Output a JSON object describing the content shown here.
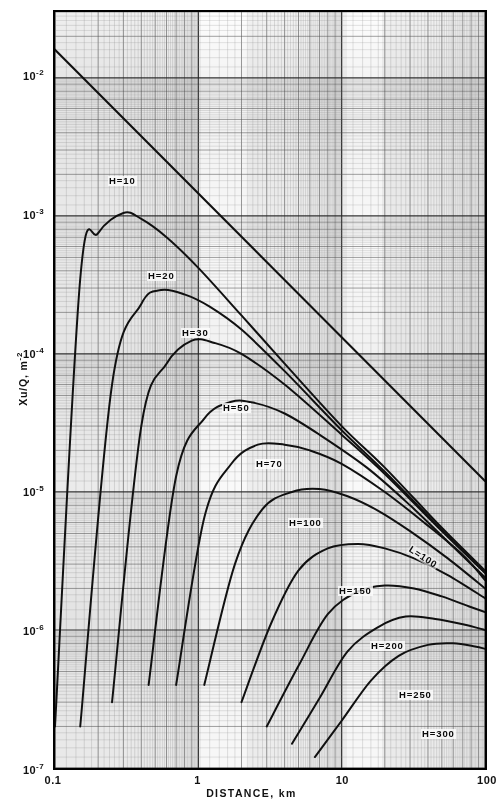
{
  "figure": {
    "title": "",
    "x_axis_title": "DISTANCE, km",
    "y_axis_title_html": "Xu/Q, m",
    "y_axis_title_exp": "-2"
  },
  "axes": {
    "x_ticks": [
      {
        "label": "0.1",
        "value": 0.1
      },
      {
        "label": "1",
        "value": 1
      },
      {
        "label": "10",
        "value": 10
      },
      {
        "label": "100",
        "value": 100
      }
    ],
    "y_ticks": [
      {
        "mantissa": "10",
        "exp": "-2",
        "value": 0.01
      },
      {
        "mantissa": "10",
        "exp": "-3",
        "value": 0.001
      },
      {
        "mantissa": "10",
        "exp": "-4",
        "value": 0.0001
      },
      {
        "mantissa": "10",
        "exp": "-5",
        "value": 1e-05
      },
      {
        "mantissa": "10",
        "exp": "-6",
        "value": 1e-06
      },
      {
        "mantissa": "10",
        "exp": "-7",
        "value": 1e-07
      }
    ]
  },
  "curve_labels": [
    {
      "text": "H=10",
      "x": 108,
      "y": 176,
      "rot": false
    },
    {
      "text": "H=20",
      "x": 147,
      "y": 271,
      "rot": false
    },
    {
      "text": "H=30",
      "x": 181,
      "y": 328,
      "rot": false
    },
    {
      "text": "H=50",
      "x": 222,
      "y": 403,
      "rot": false
    },
    {
      "text": "H=70",
      "x": 255,
      "y": 459,
      "rot": false
    },
    {
      "text": "H=100",
      "x": 288,
      "y": 518,
      "rot": false
    },
    {
      "text": "H=150",
      "x": 338,
      "y": 586,
      "rot": false
    },
    {
      "text": "H=200",
      "x": 370,
      "y": 641,
      "rot": false
    },
    {
      "text": "H=250",
      "x": 398,
      "y": 690,
      "rot": false
    },
    {
      "text": "H=300",
      "x": 421,
      "y": 729,
      "rot": false
    },
    {
      "text": "L=100",
      "x": 409,
      "y": 543,
      "rot": true
    }
  ],
  "colors": {
    "curve": "#111111",
    "frame": "#000000",
    "grid_minor": "#8d8d8d",
    "grid_major": "#2b2b2b",
    "background": "#ffffff",
    "paper": "#fdfdfd"
  },
  "chart_data": {
    "type": "line",
    "title": "",
    "xlabel": "DISTANCE, km",
    "ylabel": "Xu/Q, m-2",
    "xscale": "log",
    "yscale": "log",
    "xlim": [
      0.1,
      100
    ],
    "ylim": [
      1e-07,
      0.03
    ],
    "grid": true,
    "legend": "inline curve labels",
    "series": [
      {
        "name": "L=100",
        "label": "L=100",
        "type": "envelope-line",
        "x": [
          0.1,
          0.2,
          0.5,
          1,
          2,
          5,
          10,
          20,
          50,
          100
        ],
        "y": [
          0.016,
          0.008,
          0.003,
          0.00145,
          0.0007,
          0.00027,
          0.00013,
          6.3e-05,
          2.4e-05,
          1.2e-05
        ],
        "comment": "straight line on log-log, slope approx -1.0 from upper-left corner to lower-right"
      },
      {
        "name": "H=10",
        "label": "H=10",
        "x": [
          0.1,
          0.15,
          0.2,
          0.3,
          0.4,
          0.6,
          1.0,
          2.0,
          4.0,
          10,
          20,
          50,
          100
        ],
        "y": [
          2e-07,
          0.00035,
          0.00075,
          0.00105,
          0.00095,
          0.0007,
          0.00042,
          0.00019,
          8.5e-05,
          3e-05,
          1.5e-05,
          5.5e-06,
          2.7e-06
        ],
        "peak": {
          "x": 0.3,
          "y": 0.00105
        }
      },
      {
        "name": "H=20",
        "label": "H=20",
        "x": [
          0.15,
          0.25,
          0.4,
          0.55,
          0.8,
          1.2,
          2.0,
          4.0,
          10,
          20,
          50,
          100
        ],
        "y": [
          2e-07,
          6e-05,
          0.00023,
          0.00029,
          0.00027,
          0.00022,
          0.00015,
          7.5e-05,
          2.8e-05,
          1.4e-05,
          5.3e-06,
          2.6e-06
        ],
        "peak": {
          "x": 0.55,
          "y": 0.00029
        }
      },
      {
        "name": "H=30",
        "label": "H=30",
        "x": [
          0.25,
          0.4,
          0.6,
          0.9,
          1.3,
          2.0,
          4.0,
          10,
          20,
          50,
          100
        ],
        "y": [
          3e-07,
          3e-05,
          8.5e-05,
          0.000125,
          0.00012,
          0.0001,
          6e-05,
          2.6e-05,
          1.35e-05,
          5.2e-06,
          2.6e-06
        ],
        "peak": {
          "x": 0.95,
          "y": 0.000127
        }
      },
      {
        "name": "H=50",
        "label": "H=50",
        "x": [
          0.45,
          0.7,
          1.1,
          1.7,
          2.5,
          4.0,
          7.0,
          15,
          30,
          60,
          100
        ],
        "y": [
          4e-07,
          1.3e-05,
          3.4e-05,
          4.5e-05,
          4.4e-05,
          3.7e-05,
          2.6e-05,
          1.5e-05,
          8e-06,
          4e-06,
          2.4e-06
        ],
        "peak": {
          "x": 1.7,
          "y": 4.6e-05
        }
      },
      {
        "name": "H=70",
        "label": "H=70",
        "x": [
          0.7,
          1.1,
          1.7,
          2.6,
          4.0,
          6.0,
          10,
          20,
          40,
          70,
          100
        ],
        "y": [
          4e-07,
          6.5e-06,
          1.6e-05,
          2.2e-05,
          2.2e-05,
          2e-05,
          1.6e-05,
          1e-05,
          5.7e-06,
          3.5e-06,
          2.3e-06
        ],
        "peak": {
          "x": 2.9,
          "y": 2.25e-05
        }
      },
      {
        "name": "H=100",
        "label": "H=100",
        "x": [
          1.1,
          1.8,
          2.8,
          4.5,
          7.0,
          11,
          18,
          30,
          55,
          100
        ],
        "y": [
          4e-07,
          3e-06,
          7.5e-06,
          1e-05,
          1.05e-05,
          9.3e-06,
          7.3e-06,
          5.2e-06,
          3.3e-06,
          2e-06
        ],
        "peak": {
          "x": 5.5,
          "y": 1.06e-05
        }
      },
      {
        "name": "H=150",
        "label": "H=150",
        "x": [
          2.0,
          3.2,
          5.0,
          8.0,
          13,
          20,
          32,
          55,
          100
        ],
        "y": [
          3e-07,
          1.1e-06,
          2.7e-06,
          3.9e-06,
          4.2e-06,
          3.9e-06,
          3.3e-06,
          2.5e-06,
          1.7e-06
        ],
        "peak": {
          "x": 13,
          "y": 4.25e-06
        }
      },
      {
        "name": "H=200",
        "label": "H=200",
        "x": [
          3.0,
          5.0,
          8.0,
          13,
          20,
          32,
          50,
          75,
          100
        ],
        "y": [
          2e-07,
          5.5e-07,
          1.3e-06,
          1.9e-06,
          2.1e-06,
          2e-06,
          1.75e-06,
          1.5e-06,
          1.35e-06
        ],
        "peak": {
          "x": 22,
          "y": 2.15e-06
        }
      },
      {
        "name": "H=250",
        "label": "H=250",
        "x": [
          4.5,
          7.0,
          11,
          18,
          28,
          45,
          70,
          100
        ],
        "y": [
          1.5e-07,
          3.2e-07,
          7e-07,
          1.05e-06,
          1.25e-06,
          1.2e-06,
          1.1e-06,
          1e-06
        ],
        "peak": {
          "x": 32,
          "y": 1.27e-06
        }
      },
      {
        "name": "H=300",
        "label": "H=300",
        "x": [
          6.5,
          10,
          16,
          25,
          40,
          60,
          85,
          100
        ],
        "y": [
          1.2e-07,
          2.2e-07,
          4.3e-07,
          6.5e-07,
          7.8e-07,
          8e-07,
          7.6e-07,
          7.3e-07
        ],
        "peak": {
          "x": 55,
          "y": 8.1e-07
        }
      }
    ]
  }
}
